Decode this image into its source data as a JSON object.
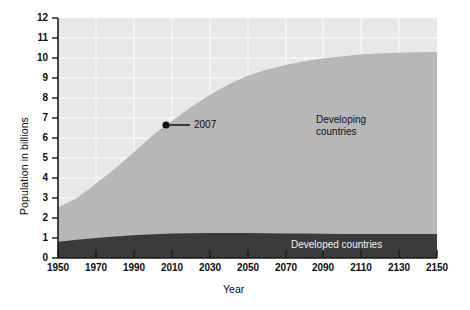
{
  "chart_data": {
    "type": "area",
    "title": "",
    "subtitle": "",
    "xlabel": "Year",
    "ylabel": "Population in billions",
    "xlim": [
      1950,
      2150
    ],
    "ylim": [
      0,
      12
    ],
    "stacked": true,
    "grid": true,
    "legend_position": "inline-annotations",
    "xticks": [
      1950,
      1970,
      1990,
      2010,
      2030,
      2050,
      2070,
      2090,
      2110,
      2130,
      2150
    ],
    "xtick_labels": [
      "1950",
      "1970",
      "1990",
      "2010",
      "2030",
      "2050",
      "2070",
      "2090",
      "2110",
      "2130",
      "2150"
    ],
    "yticks": [
      0,
      1,
      2,
      3,
      4,
      5,
      6,
      7,
      8,
      9,
      10,
      11,
      12
    ],
    "ytick_labels": [
      "0",
      "1",
      "2",
      "3",
      "4",
      "5",
      "6",
      "7",
      "8",
      "9",
      "10",
      "11",
      "12"
    ],
    "x": [
      1950,
      1960,
      1970,
      1980,
      1990,
      2000,
      2007,
      2010,
      2020,
      2030,
      2040,
      2050,
      2060,
      2070,
      2080,
      2090,
      2100,
      2110,
      2120,
      2130,
      2140,
      2150
    ],
    "series": [
      {
        "name": "Developed countries",
        "color": "#3b3b3b",
        "values": [
          0.81,
          0.91,
          1.0,
          1.08,
          1.14,
          1.19,
          1.21,
          1.22,
          1.24,
          1.25,
          1.25,
          1.25,
          1.24,
          1.23,
          1.22,
          1.21,
          1.2,
          1.2,
          1.2,
          1.2,
          1.2,
          1.2
        ]
      },
      {
        "name": "Developing countries",
        "color": "#b7b7b7",
        "values": [
          1.72,
          2.08,
          2.7,
          3.37,
          4.13,
          4.94,
          5.44,
          5.6,
          6.28,
          6.89,
          7.42,
          7.85,
          8.16,
          8.41,
          8.6,
          8.76,
          8.88,
          8.97,
          9.03,
          9.06,
          9.08,
          9.1
        ]
      }
    ],
    "totals": [
      2.53,
      2.99,
      3.7,
      4.45,
      5.27,
      6.13,
      6.65,
      6.82,
      7.52,
      8.14,
      8.67,
      9.1,
      9.4,
      9.64,
      9.82,
      9.97,
      10.08,
      10.17,
      10.23,
      10.26,
      10.28,
      10.3
    ],
    "annotations": [
      {
        "label": "2007",
        "x": 2007,
        "y": 6.65,
        "marker": "dot",
        "leader_line": true
      }
    ],
    "band_labels": [
      {
        "name": "developing",
        "line1": "Developing",
        "line2": "countries"
      },
      {
        "name": "developed",
        "line1": "Developed countries"
      }
    ],
    "colors": {
      "plot_background": "#e8e8e8",
      "gridline": "#fafafa",
      "developing": "#b7b7b7",
      "developed": "#3b3b3b",
      "axis": "#1a1a1a",
      "text": "#0d0d0d",
      "developed_label_text": "#f2f2f2",
      "page_background": "#ffffff"
    }
  }
}
